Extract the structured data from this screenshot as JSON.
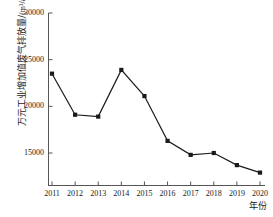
{
  "chart_data": {
    "type": "line",
    "title": "",
    "subtitle": "",
    "xlabel": "年份",
    "ylabel": "万元工业增加值废气排放量/(m³/a)",
    "ylabel_text": "万元工业增加值废气排放量/",
    "ylabel_unit": "(m³/a)",
    "categories": [
      "2011",
      "2012",
      "2013",
      "2014",
      "2015",
      "2016",
      "2017",
      "2018",
      "2019",
      "2020"
    ],
    "x": [
      2011,
      2012,
      2013,
      2014,
      2015,
      2016,
      2017,
      2018,
      2019,
      2020
    ],
    "values": [
      23500,
      19100,
      18900,
      23900,
      21100,
      16300,
      14800,
      15000,
      13700,
      12900
    ],
    "series": [
      {
        "name": "万元工业增加值废气排放量",
        "values": [
          23500,
          19100,
          18900,
          23900,
          21100,
          16300,
          14800,
          15000,
          13700,
          12900
        ]
      }
    ],
    "ytick_labels": [
      "15000",
      "20000",
      "25000",
      "30000"
    ],
    "ytick_values": [
      15000,
      20000,
      25000,
      30000
    ],
    "xtick_labels": [
      "2011",
      "2012",
      "2013",
      "2014",
      "2015",
      "2016",
      "2017",
      "2018",
      "2019",
      "2020"
    ],
    "ylim": [
      11500,
      30000
    ],
    "xlim": [
      2011,
      2020
    ],
    "grid": false,
    "legend": false,
    "legend_position": "none",
    "marker": "square",
    "line_color": "#1a1a1a",
    "marker_color": "#1a1a1a",
    "axis_color": "#555555",
    "background_color": "#ffffff"
  }
}
